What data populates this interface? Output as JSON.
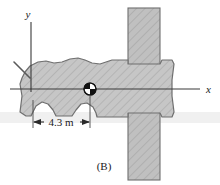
{
  "figure": {
    "caption": "(B)",
    "axis_x_label": "x",
    "axis_y_label": "y",
    "dimension_label": "4.3 m",
    "colors": {
      "body_fill": "#c3c3c3",
      "body_stroke": "#6b6b6b",
      "post_fill": "#bdbdbd",
      "post_stroke": "#6b6b6b",
      "axis_line": "#3a3a3a",
      "hatch": "#b2b2b2",
      "text": "#1a1a1a",
      "background": "#ffffff",
      "scan_band": "#e6e6e6"
    },
    "elements": {
      "vehicle_name": "car-top-view-silhouette",
      "post_name": "vertical-hatched-post",
      "com_marker_name": "center-of-mass-marker",
      "antenna_name": "antenna-line"
    },
    "geometry": {
      "axis_x_y": 89,
      "axis_x_start": 10,
      "axis_x_end": 200,
      "axis_y_x": 31,
      "axis_y_top": 22,
      "axis_y_bottom": 92,
      "com_x": 90,
      "com_y": 89,
      "com_radius": 6,
      "dim_line_y": 122,
      "dim_left_x": 33,
      "dim_right_x": 90,
      "post_x": 128,
      "post_width": 32,
      "post_top": 8,
      "post_bottom": 180
    }
  }
}
